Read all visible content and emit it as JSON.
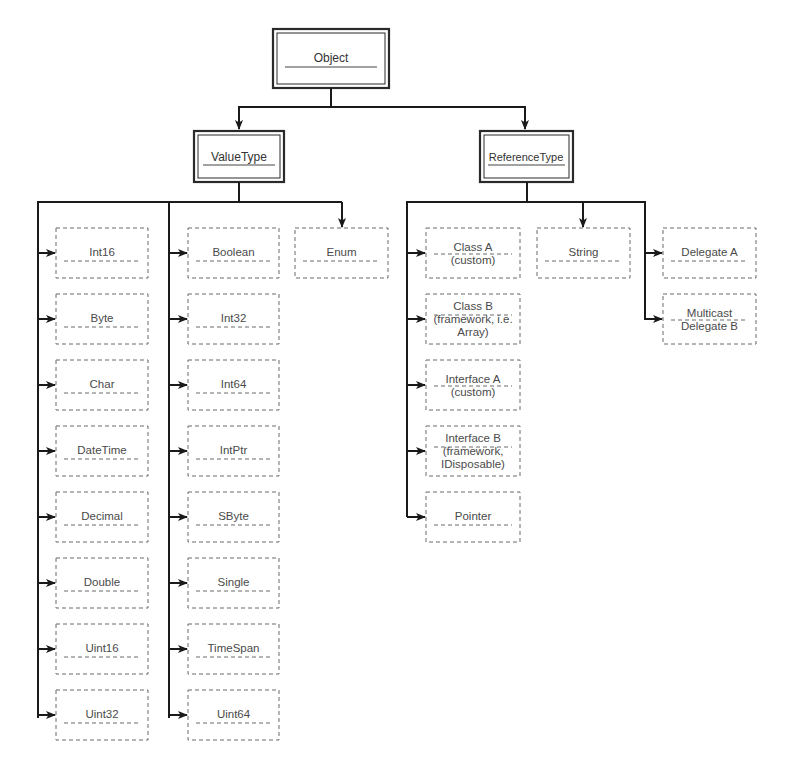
{
  "diagram": {
    "root": {
      "label": "Object"
    },
    "categories": [
      {
        "label": "ValueType"
      },
      {
        "label": "ReferenceType"
      }
    ],
    "value_types": {
      "column1": [
        "Int16",
        "Byte",
        "Char",
        "DateTime",
        "Decimal",
        "Double",
        "Uint16",
        "Uint32"
      ],
      "column2": [
        "Boolean",
        "Int32",
        "Int64",
        "IntPtr",
        "SByte",
        "Single",
        "TimeSpan",
        "Uint64"
      ],
      "column3": [
        "Enum"
      ]
    },
    "reference_types": {
      "column1": [
        {
          "lines": [
            "Class A",
            "(custom)"
          ]
        },
        {
          "lines": [
            "Class B",
            "(framework, i.e.",
            "Array)"
          ]
        },
        {
          "lines": [
            "Interface A",
            "(custom)"
          ]
        },
        {
          "lines": [
            "Interface B",
            "(framework,",
            "IDisposable)"
          ]
        },
        {
          "lines": [
            "Pointer"
          ]
        }
      ],
      "column2": [
        {
          "lines": [
            "String"
          ]
        }
      ],
      "column3": [
        {
          "lines": [
            "Delegate A"
          ]
        },
        {
          "lines": [
            "Multicast",
            "Delegate B"
          ]
        }
      ]
    },
    "colors": {
      "connector": "#1a1a1a",
      "dashed_border": "#6a6a6a",
      "text": "#4a4a4a"
    }
  }
}
